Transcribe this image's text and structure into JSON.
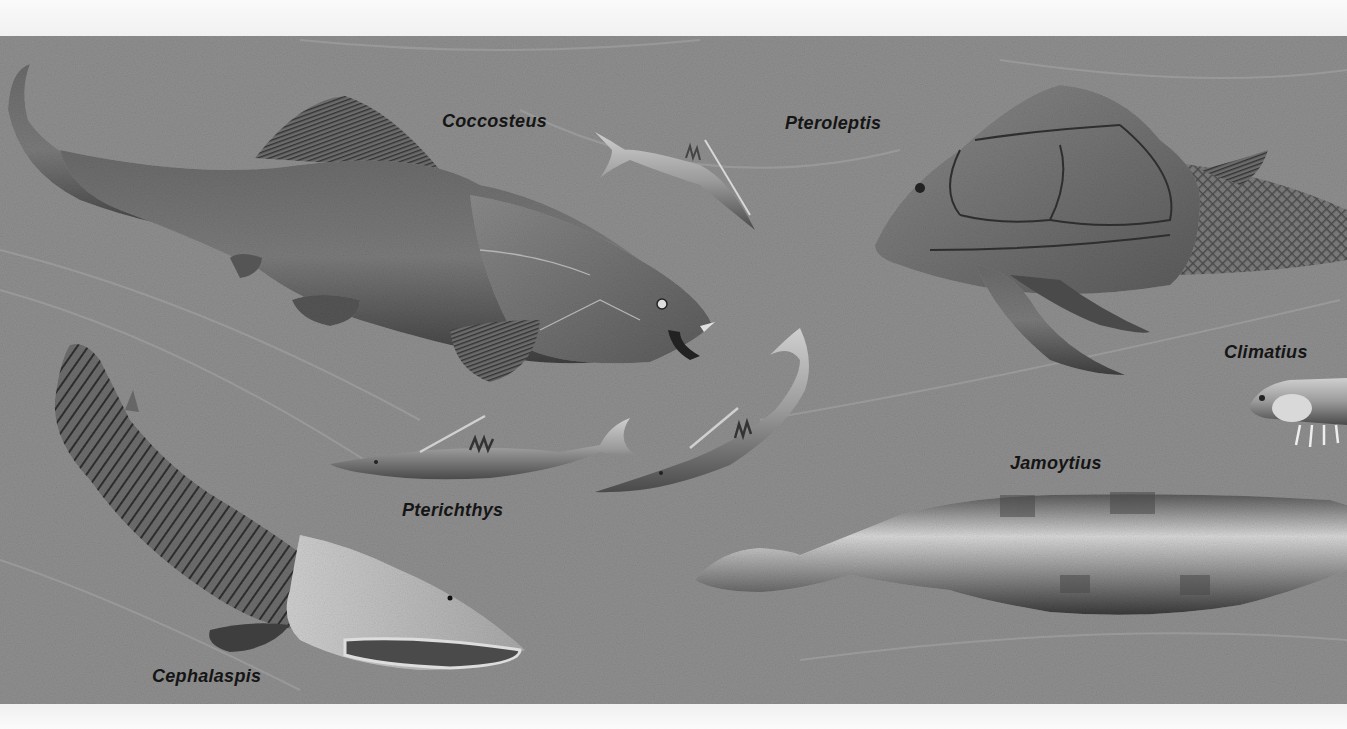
{
  "illustration": {
    "subject": "Devonian fishes",
    "background_color": "#8e8e8e",
    "labels": [
      {
        "id": "coccosteus",
        "text": "Coccosteus",
        "x": 442,
        "y": 111
      },
      {
        "id": "pteroleptis",
        "text": "Pteroleptis",
        "x": 785,
        "y": 113
      },
      {
        "id": "climatius",
        "text": "Climatius",
        "x": 1224,
        "y": 342
      },
      {
        "id": "jamoytius",
        "text": "Jamoytius",
        "x": 1010,
        "y": 453
      },
      {
        "id": "pterichthys",
        "text": "Pterichthys",
        "x": 402,
        "y": 500
      },
      {
        "id": "cephalaspis",
        "text": "Cephalaspis",
        "x": 152,
        "y": 666
      }
    ]
  }
}
